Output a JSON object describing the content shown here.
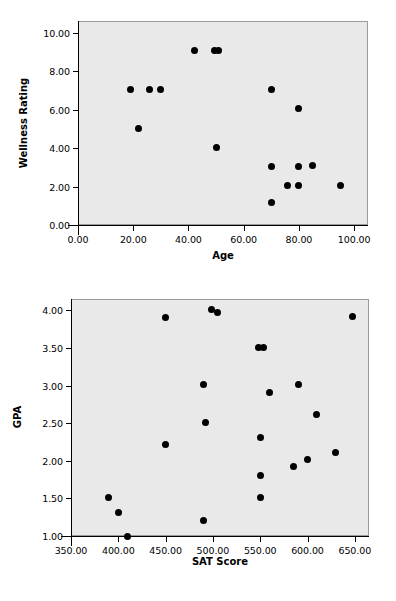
{
  "chart_data": [
    {
      "type": "scatter",
      "title": "",
      "xlabel": "Age",
      "ylabel": "Wellness Rating",
      "xlim": [
        0,
        105
      ],
      "ylim": [
        0,
        10.6
      ],
      "grid": false,
      "legend": "none",
      "xticks": [
        "0.00",
        "20.00",
        "40.00",
        "60.00",
        "80.00",
        "100.00"
      ],
      "xtickvals": [
        0,
        20,
        40,
        60,
        80,
        100
      ],
      "yticks": [
        "0.00",
        "2.00",
        "4.00",
        "6.00",
        "8.00",
        "10.00"
      ],
      "ytickvals": [
        0,
        2,
        4,
        6,
        8,
        10
      ],
      "points": [
        {
          "x": 42,
          "y": 9.05
        },
        {
          "x": 49.5,
          "y": 9.05
        },
        {
          "x": 51,
          "y": 9.05
        },
        {
          "x": 19,
          "y": 7.02
        },
        {
          "x": 26,
          "y": 7.02
        },
        {
          "x": 30,
          "y": 7.02
        },
        {
          "x": 70,
          "y": 7.05
        },
        {
          "x": 80,
          "y": 6.05
        },
        {
          "x": 22,
          "y": 5.0
        },
        {
          "x": 50,
          "y": 4.05
        },
        {
          "x": 70,
          "y": 3.05
        },
        {
          "x": 80,
          "y": 3.05
        },
        {
          "x": 85,
          "y": 3.1
        },
        {
          "x": 76,
          "y": 2.05
        },
        {
          "x": 80,
          "y": 2.05
        },
        {
          "x": 95,
          "y": 2.05
        },
        {
          "x": 70,
          "y": 1.15
        }
      ]
    },
    {
      "type": "scatter",
      "title": "",
      "xlabel": "SAT Score",
      "ylabel": "GPA",
      "xlim": [
        350,
        665
      ],
      "ylim": [
        1.0,
        4.15
      ],
      "grid": false,
      "legend": "none",
      "xticks": [
        "350.00",
        "400.00",
        "450.00",
        "500.00",
        "550.00",
        "600.00",
        "650.00"
      ],
      "xtickvals": [
        350,
        400,
        450,
        500,
        550,
        600,
        650
      ],
      "yticks": [
        "1.00",
        "1.50",
        "2.00",
        "2.50",
        "3.00",
        "3.50",
        "4.00"
      ],
      "ytickvals": [
        1.0,
        1.5,
        2.0,
        2.5,
        3.0,
        3.5,
        4.0
      ],
      "points": [
        {
          "x": 450,
          "y": 3.9
        },
        {
          "x": 499,
          "y": 4.01
        },
        {
          "x": 505,
          "y": 3.97
        },
        {
          "x": 648,
          "y": 3.92
        },
        {
          "x": 548,
          "y": 3.51
        },
        {
          "x": 554,
          "y": 3.51
        },
        {
          "x": 490,
          "y": 3.01
        },
        {
          "x": 590,
          "y": 3.01
        },
        {
          "x": 560,
          "y": 2.91
        },
        {
          "x": 610,
          "y": 2.61
        },
        {
          "x": 492,
          "y": 2.51
        },
        {
          "x": 550,
          "y": 2.31
        },
        {
          "x": 450,
          "y": 2.21
        },
        {
          "x": 630,
          "y": 2.11
        },
        {
          "x": 600,
          "y": 2.02
        },
        {
          "x": 585,
          "y": 1.92
        },
        {
          "x": 550,
          "y": 1.81
        },
        {
          "x": 550,
          "y": 1.51
        },
        {
          "x": 390,
          "y": 1.51
        },
        {
          "x": 400,
          "y": 1.31
        },
        {
          "x": 490,
          "y": 1.21
        },
        {
          "x": 410,
          "y": 1.0
        }
      ]
    }
  ],
  "layout": {
    "plot_bg_color": "#e9e9e9",
    "point_color": "#000000",
    "axis_color": "#000000",
    "page_bg_color": "#ffffff"
  }
}
